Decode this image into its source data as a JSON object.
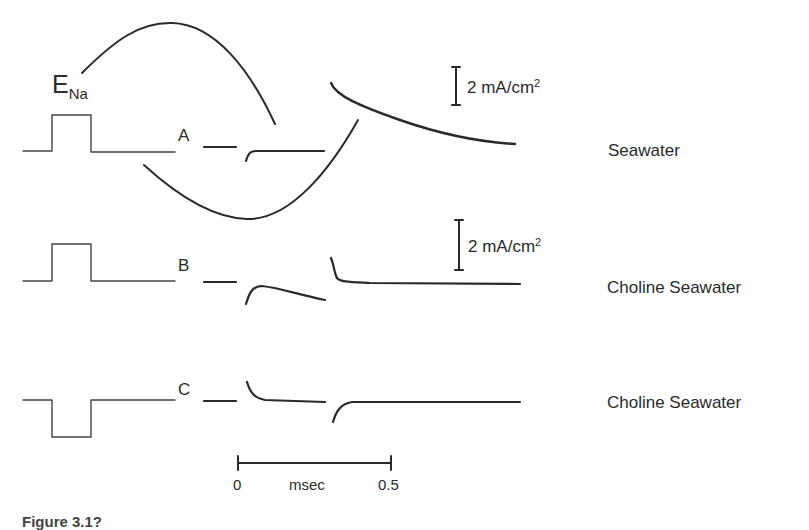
{
  "figure": {
    "reversal_label": {
      "main": "E",
      "sub": "Na"
    },
    "rows": [
      {
        "id": "A",
        "label": "A",
        "condition": "Seawater",
        "pulse": "depolarizing",
        "scale_bar": "2 mA/cm",
        "scale_sup": "2"
      },
      {
        "id": "B",
        "label": "B",
        "condition": "Choline Seawater",
        "pulse": "depolarizing",
        "scale_bar": "2 mA/cm",
        "scale_sup": "2"
      },
      {
        "id": "C",
        "label": "C",
        "condition": "Choline Seawater",
        "pulse": "hyperpolarizing"
      }
    ],
    "time_scale": {
      "start": "0",
      "unit": "msec",
      "end": "0.5"
    },
    "caption": "Figure 3.1?"
  },
  "colors": {
    "ink": "#2a2a2a",
    "background": "#ffffff"
  }
}
